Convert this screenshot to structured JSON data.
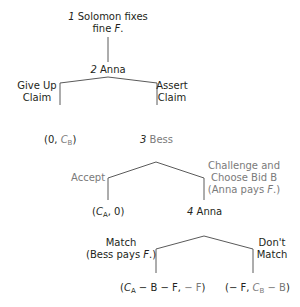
{
  "diagram": {
    "type": "game-tree",
    "colors": {
      "anna": "#231f20",
      "bess": "#7a7a7a",
      "line": "#5a5a5a"
    },
    "nodes": {
      "n1": {
        "number": "1",
        "label": "Solomon fixes",
        "label2": "fine ",
        "var": "F",
        "tail": "."
      },
      "n2": {
        "number": "2",
        "label": "Anna"
      },
      "n3": {
        "number": "3",
        "label": "Bess"
      },
      "n4": {
        "number": "4",
        "label": "Anna"
      }
    },
    "edges": {
      "give_up": {
        "line1": "Give Up",
        "line2": "Claim"
      },
      "assert": {
        "line1": "Assert",
        "line2": "Claim"
      },
      "accept": {
        "line1": "Accept"
      },
      "challenge": {
        "line1": "Challenge and",
        "line2": "Choose Bid B",
        "line3a": "(Anna pays ",
        "line3var": "F",
        "line3b": ".)"
      },
      "match": {
        "line1": "Match",
        "line2a": "(Bess pays ",
        "line2var": "F",
        "line2b": ".)"
      },
      "dont_match": {
        "line1": "Don't",
        "line2": "Match"
      }
    },
    "payoffs": {
      "p1": {
        "open": "(0, ",
        "var": "C",
        "sub": "B",
        "close": ")"
      },
      "p2": {
        "open": "(",
        "var": "C",
        "sub": "A",
        "mid": ", 0)"
      },
      "p3": {
        "anna_open": "(",
        "anna_var": "C",
        "anna_sub": "A",
        "anna_rest": " − B − F, ",
        "bess": "− F",
        "close": ")"
      },
      "p4": {
        "anna": "(− F, ",
        "bess_var": "C",
        "bess_sub": "B",
        "bess_rest": " − B",
        "close": ")"
      }
    }
  }
}
